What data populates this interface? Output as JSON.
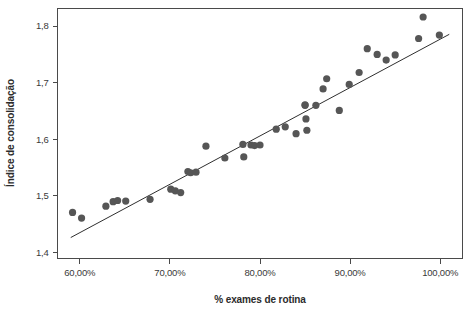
{
  "chart_data": {
    "type": "scatter",
    "title": "",
    "subtitle": "",
    "xlabel": "% exames de rotina",
    "ylabel": "Índice de consolidação",
    "xlim": [
      57.53,
      102.47
    ],
    "ylim": [
      1.3896,
      1.831
    ],
    "grid": false,
    "legend": null,
    "marker_color": "#565656",
    "line_color": "#2f2f2f",
    "axis_color": "#4a4a4a",
    "background_color": "#ffffff",
    "xticks": [
      60,
      70,
      80,
      90,
      100
    ],
    "xticklabels": [
      "60,00%",
      "70,00%",
      "80,00%",
      "90,00%",
      "100,00%"
    ],
    "yticks": [
      1.4,
      1.5,
      1.6,
      1.7,
      1.8
    ],
    "yticklabels": [
      "1,4",
      "1,5",
      "1,6",
      "1,7",
      "1,8"
    ],
    "series": [
      {
        "name": "observations",
        "marker": "circle",
        "x": [
          59.2,
          60.2,
          62.9,
          63.7,
          64.2,
          65.1,
          67.8,
          70.1,
          70.6,
          71.2,
          72.0,
          72.3,
          72.9,
          74.0,
          76.1,
          78.1,
          78.2,
          79.0,
          79.4,
          80.0,
          81.8,
          82.8,
          84.0,
          85.0,
          85.0,
          85.1,
          85.2,
          86.2,
          87.0,
          87.4,
          88.8,
          89.9,
          91.0,
          91.9,
          93.0,
          94.0,
          95.0,
          97.6,
          98.1,
          99.9
        ],
        "y": [
          1.471,
          1.461,
          1.482,
          1.49,
          1.492,
          1.491,
          1.494,
          1.512,
          1.509,
          1.506,
          1.543,
          1.541,
          1.542,
          1.588,
          1.567,
          1.591,
          1.569,
          1.59,
          1.589,
          1.59,
          1.618,
          1.622,
          1.61,
          1.661,
          1.66,
          1.636,
          1.616,
          1.66,
          1.689,
          1.707,
          1.651,
          1.697,
          1.718,
          1.76,
          1.75,
          1.74,
          1.749,
          1.778,
          1.816,
          1.784
        ]
      }
    ],
    "trend_line": {
      "name": "linear fit",
      "x": [
        59.0,
        101.0
      ],
      "y": [
        1.4266,
        1.7854
      ]
    }
  }
}
